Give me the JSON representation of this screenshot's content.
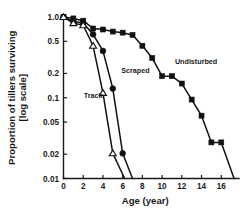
{
  "chart_data": {
    "type": "line",
    "title": "",
    "xlabel": "Age (year)",
    "ylabel": "Proportion of tillers surviving [log scale]",
    "ylabel_line1": "Proportion of tillers surviving",
    "ylabel_line2": "[log scale]",
    "yscale": "log",
    "ylim": [
      0.01,
      1.0
    ],
    "xlim": [
      0,
      17.8
    ],
    "grid": false,
    "legend": "inline-annotations",
    "xticks": [
      0,
      2,
      4,
      6,
      8,
      10,
      12,
      14,
      16
    ],
    "xticklabels": [
      "0",
      "2",
      "4",
      "6",
      "8",
      "10",
      "12",
      "14",
      "16"
    ],
    "yticks": [
      1.0,
      0.5,
      0.2,
      0.1,
      0.05,
      0.02,
      0.01
    ],
    "yticklabels": [
      "1.0",
      "0.5",
      "0.2",
      "0.1",
      "0.05",
      "0.02",
      "0.01"
    ],
    "series": [
      {
        "name": "Undisturbed",
        "marker": "filled-square",
        "color": "#111111",
        "label_x": 11.3,
        "label_y": 0.265,
        "x": [
          0,
          1,
          2,
          3,
          4,
          5,
          6,
          7,
          8,
          9,
          10,
          11,
          12,
          13,
          14,
          15,
          16,
          17.3
        ],
        "y": [
          1.0,
          0.96,
          0.9,
          0.72,
          0.7,
          0.66,
          0.64,
          0.6,
          0.44,
          0.31,
          0.185,
          0.185,
          0.15,
          0.095,
          0.06,
          0.028,
          0.028,
          0.0095
        ]
      },
      {
        "name": "Scraped",
        "marker": "filled-circle",
        "color": "#111111",
        "label_x": 5.85,
        "label_y": 0.205,
        "x": [
          0,
          1,
          2,
          3,
          4,
          5,
          6,
          7
        ],
        "y": [
          1.0,
          0.88,
          0.84,
          0.61,
          0.38,
          0.13,
          0.0205,
          0.0082
        ]
      },
      {
        "name": "Track",
        "marker": "open-triangle",
        "color": "#111111",
        "label_x": 2.05,
        "label_y": 0.098,
        "x": [
          0,
          1,
          2,
          3,
          4,
          5,
          6.2
        ],
        "y": [
          1.0,
          0.84,
          0.79,
          0.44,
          0.115,
          0.0205,
          0.0082
        ]
      }
    ]
  }
}
